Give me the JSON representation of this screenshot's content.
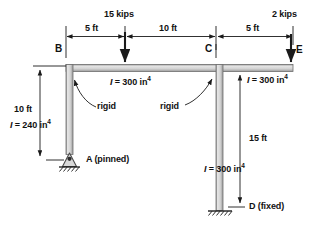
{
  "figure": {
    "type": "structural-frame-diagram"
  },
  "loads": [
    {
      "id": "load-15kips",
      "label": "15 kips",
      "magnitude": 15,
      "unit": "kips",
      "direction": "down",
      "x": 125,
      "applied_at": "5 ft right of B"
    },
    {
      "id": "load-2kips",
      "label": "2 kips",
      "magnitude": 2,
      "unit": "kips",
      "direction": "down",
      "x": 291,
      "applied_at": "joint E"
    }
  ],
  "dimensions": {
    "horizontal": [
      {
        "id": "dim-5ft-left",
        "label": "5 ft",
        "value": 5,
        "unit": "ft",
        "from": "B",
        "to": "15 kips load"
      },
      {
        "id": "dim-10ft",
        "label": "10 ft",
        "value": 10,
        "unit": "ft",
        "from": "15 kips load",
        "to": "C"
      },
      {
        "id": "dim-5ft-right",
        "label": "5 ft",
        "value": 5,
        "unit": "ft",
        "from": "C",
        "to": "E"
      }
    ],
    "vertical": [
      {
        "id": "dim-10ft-left",
        "label": "10 ft",
        "value": 10,
        "unit": "ft",
        "from": "B",
        "to": "A"
      },
      {
        "id": "dim-15ft-right",
        "label": "15 ft",
        "value": 15,
        "unit": "ft",
        "from": "E",
        "to": "D"
      }
    ]
  },
  "members": [
    {
      "id": "column-AB",
      "inertia_label": "I = 240 in4",
      "i_prefix": "I",
      "i_eq": " = 240 in",
      "i_exp": "4",
      "value": 240,
      "unit": "in^4"
    },
    {
      "id": "beam-BE",
      "inertia_label": "I = 300 in4",
      "i_prefix": "I",
      "i_eq": " = 300 in",
      "i_exp": "4",
      "value": 300,
      "unit": "in^4"
    },
    {
      "id": "column-CE-upper",
      "inertia_label": "I = 300 in4",
      "i_prefix": "I",
      "i_eq": " = 300 in",
      "i_exp": "4",
      "value": 300,
      "unit": "in^4"
    },
    {
      "id": "column-CD",
      "inertia_label": "I = 300 in4",
      "i_prefix": "I",
      "i_eq": " = 300 in",
      "i_exp": "4",
      "value": 300,
      "unit": "in^4"
    }
  ],
  "joints": [
    {
      "id": "joint-B",
      "label": "B",
      "type": "corner"
    },
    {
      "id": "joint-C",
      "label": "C",
      "type": "tee"
    },
    {
      "id": "joint-E",
      "label": "E",
      "type": "corner"
    },
    {
      "id": "support-A",
      "label": "A (pinned)",
      "type": "pinned"
    },
    {
      "id": "support-D",
      "label": "D (fixed)",
      "type": "fixed"
    }
  ],
  "annotations": [
    {
      "id": "rigid-left",
      "label": "rigid",
      "points_to": "joint-B"
    },
    {
      "id": "rigid-right",
      "label": "rigid",
      "points_to": "joint-C"
    }
  ],
  "colors": {
    "member_fill": "#d8d8d8",
    "member_edge": "#6b6b6b",
    "line": "#1a1a1a",
    "background": "#ffffff"
  }
}
